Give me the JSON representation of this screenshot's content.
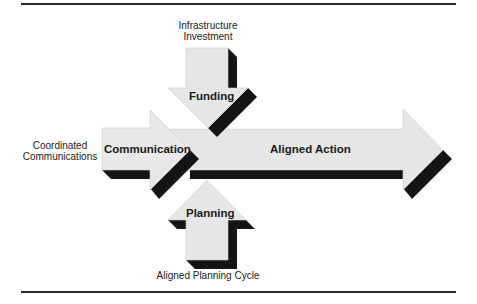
{
  "diagram": {
    "colors": {
      "arrow_fill": "#e6e6e6",
      "arrow_stroke": "#cfcfcf",
      "shadow": "#141414",
      "rule": "#2a2a2a",
      "text": "#222222"
    },
    "arrows": {
      "funding": {
        "label": "Funding",
        "source_label_line1": "Infrastructure",
        "source_label_line2": "Investment",
        "direction": "down"
      },
      "communication": {
        "label": "Communication",
        "source_label_line1": "Coordinated",
        "source_label_line2": "Communications",
        "direction": "right"
      },
      "planning": {
        "label": "Planning",
        "source_label_line1": "Aligned Planning Cycle",
        "direction": "up"
      },
      "aligned_action": {
        "label": "Aligned Action",
        "direction": "right"
      }
    }
  }
}
